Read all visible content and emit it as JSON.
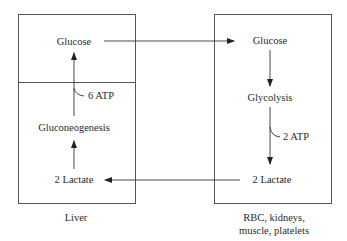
{
  "diagram": {
    "liver": {
      "caption": "Liver",
      "nodes": {
        "glucose": "Glucose",
        "atp": "6 ATP",
        "gluconeogenesis": "Gluconeogenesis",
        "lactate": "2 Lactate"
      }
    },
    "tissues": {
      "caption_line1": "RBC, kidneys,",
      "caption_line2": "muscle, platelets",
      "nodes": {
        "glucose": "Glucose",
        "glycolysis": "Glycolysis",
        "atp": "2 ATP",
        "lactate": "2 Lactate"
      }
    },
    "edges": [
      {
        "from": "liver.glucose",
        "to": "tissues.glucose"
      },
      {
        "from": "tissues.glucose",
        "to": "tissues.glycolysis"
      },
      {
        "from": "tissues.glycolysis",
        "to": "tissues.lactate",
        "label": "2 ATP"
      },
      {
        "from": "tissues.lactate",
        "to": "liver.lactate"
      },
      {
        "from": "liver.lactate",
        "to": "liver.gluconeogenesis"
      },
      {
        "from": "liver.gluconeogenesis",
        "to": "liver.glucose",
        "label": "6 ATP"
      }
    ]
  }
}
